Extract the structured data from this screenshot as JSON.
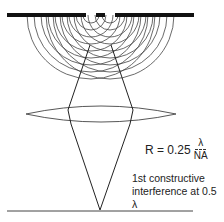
{
  "diagram": {
    "type": "double-slit interference through lens",
    "formula": {
      "lhs": "R = 0.25",
      "numerator": "λ",
      "denominator": "NA"
    },
    "caption": {
      "line1": "1st constructive",
      "line2": "interference at 0.5 λ"
    },
    "colors": {
      "stroke": "#333333",
      "barrier": "#111111",
      "background": "#ffffff"
    }
  }
}
